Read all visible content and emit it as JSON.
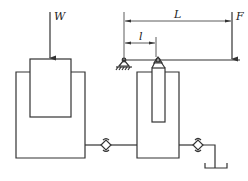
{
  "diagram": {
    "labels": {
      "load": "W",
      "force": "F",
      "lever_length": "L",
      "pivot_distance": "l"
    },
    "components": [
      {
        "id": "large-cylinder",
        "label": "W"
      },
      {
        "id": "check-valve-1"
      },
      {
        "id": "small-cylinder"
      },
      {
        "id": "check-valve-2"
      },
      {
        "id": "reservoir-tank"
      },
      {
        "id": "lever-beam",
        "label": "F"
      }
    ],
    "colors": {
      "line": "#333333",
      "background": "#ffffff"
    }
  }
}
